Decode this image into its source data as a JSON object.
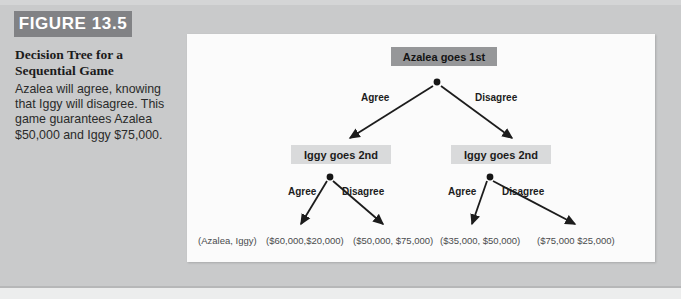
{
  "figure": {
    "tag": "FIGURE 13.5",
    "title": "Decision Tree for a Sequential Game",
    "caption": "Azalea will agree, knowing that Iggy will disagree. This game guarantees Azalea $50,000 and Iggy $75,000."
  },
  "colors": {
    "page_background": "#c9cacb",
    "tag_background": "#818285",
    "tag_text": "#ffffff",
    "panel_background": "#fbfbfb",
    "root_node_background": "#969799",
    "level2_node_background": "#d9dadb",
    "edge_stroke": "#1c1c1c",
    "payoff_text": "#4a4b4d"
  },
  "diagram": {
    "root_node": "Azalea goes 1st",
    "level2_left_node": "Iggy goes 2nd",
    "level2_right_node": "Iggy goes 2nd",
    "root_edge_left_label": "Agree",
    "root_edge_right_label": "Disagree",
    "left_subtree_edge_left_label": "Agree",
    "left_subtree_edge_right_label": "Disagree",
    "right_subtree_edge_left_label": "Agree",
    "right_subtree_edge_right_label": "Disagree",
    "payoff_key": "(Azalea, Iggy)",
    "payoffs": [
      "($60,000,$20,000)",
      "($50,000, $75,000)",
      "($35,000, $50,000)",
      "($75,000 $25,000)"
    ]
  }
}
